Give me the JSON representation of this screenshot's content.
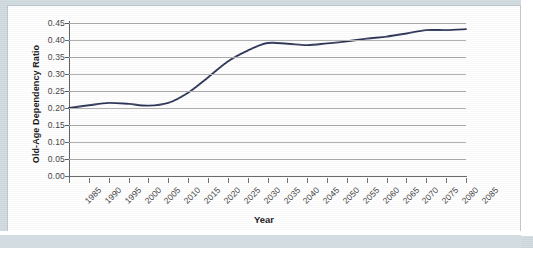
{
  "figure": {
    "y_axis_title": "Old-Age Dependency Ratio",
    "x_axis_title": "Year",
    "line_color": "#2b3356",
    "grid_color": "#a9a9a9",
    "axis_color": "#5a5a5a",
    "background_color": "#fefefe",
    "mat_color": "#cfd9de"
  },
  "chart_data": {
    "type": "line",
    "title": "",
    "xlabel": "Year",
    "ylabel": "Old-Age Dependency Ratio",
    "xlim": [
      1985,
      2085
    ],
    "ylim": [
      0.0,
      0.45
    ],
    "grid": "horizontal",
    "legend": "none",
    "y_ticks": [
      "0.00",
      "0.05",
      "0.10",
      "0.15",
      "0.20",
      "0.25",
      "0.30",
      "0.35",
      "0.40",
      "0.45"
    ],
    "y_tick_values": [
      0.0,
      0.05,
      0.1,
      0.15,
      0.2,
      0.25,
      0.3,
      0.35,
      0.4,
      0.45
    ],
    "x_ticks": [
      "1985",
      "1990",
      "1995",
      "2000",
      "2005",
      "2010",
      "2015",
      "2020",
      "2025",
      "2030",
      "2035",
      "2040",
      "2045",
      "2050",
      "2055",
      "2060",
      "2065",
      "2070",
      "2075",
      "2080",
      "2085"
    ],
    "x": [
      1985,
      1990,
      1995,
      2000,
      2005,
      2010,
      2015,
      2020,
      2025,
      2030,
      2035,
      2040,
      2045,
      2050,
      2055,
      2060,
      2065,
      2070,
      2075,
      2080,
      2085
    ],
    "series": [
      {
        "name": "Old-Age Dependency Ratio",
        "color": "#2b3356",
        "values": [
          0.2,
          0.208,
          0.215,
          0.212,
          0.207,
          0.215,
          0.245,
          0.29,
          0.337,
          0.369,
          0.391,
          0.389,
          0.385,
          0.39,
          0.396,
          0.404,
          0.41,
          0.419,
          0.429,
          0.429,
          0.432
        ]
      }
    ]
  }
}
